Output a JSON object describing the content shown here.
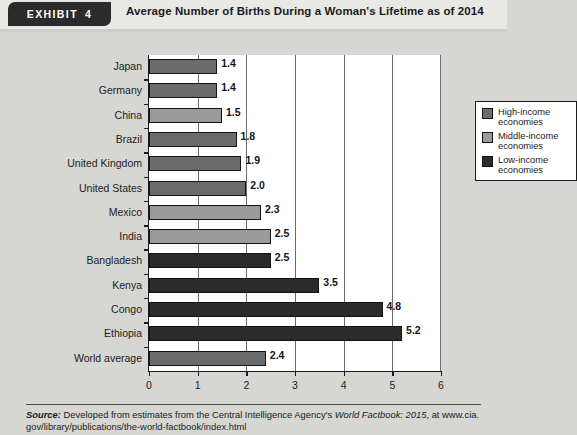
{
  "header": {
    "tag_word": "EXHIBIT",
    "tag_number": "4",
    "title": "Average Number of Births During a Woman's Lifetime as of 2014"
  },
  "legend": {
    "position": "top-right-inside-plot",
    "items": [
      {
        "label": "High-income economies",
        "line1": "High-income",
        "line2": "economies",
        "color": "#6b6b6b"
      },
      {
        "label": "Middle-income economies",
        "line1": "Middle-income",
        "line2": "economies",
        "color": "#9a9a9a"
      },
      {
        "label": "Low-income economies",
        "line1": "Low-income",
        "line2": "economies",
        "color": "#2b2b2b"
      }
    ]
  },
  "source": {
    "label": "Source:",
    "line1": "Developed from estimates from the Central Intelligence Agency's ",
    "italic_title": "World Factbook: 2015",
    "line1_tail": ", at www.cia.",
    "line2": "gov/library/publications/the-world-factbook/index.html"
  },
  "chart_data": {
    "type": "bar",
    "orientation": "horizontal",
    "title": "Average Number of Births During a Woman's Lifetime as of 2014",
    "xlabel": "",
    "ylabel": "",
    "xlim": [
      0,
      6
    ],
    "xticks": [
      "0",
      "1",
      "2",
      "3",
      "4",
      "5",
      "6"
    ],
    "grid": "vertical",
    "categories": [
      "Japan",
      "Germany",
      "China",
      "Brazil",
      "United Kingdom",
      "United States",
      "Mexico",
      "India",
      "Bangladesh",
      "Kenya",
      "Congo",
      "Ethiopia",
      "World average"
    ],
    "values": [
      1.4,
      1.4,
      1.5,
      1.8,
      1.9,
      2.0,
      2.3,
      2.5,
      2.5,
      3.5,
      4.8,
      5.2,
      2.4
    ],
    "value_labels": [
      "1.4",
      "1.4",
      "1.5",
      "1.8",
      "1.9",
      "2.0",
      "2.3",
      "2.5",
      "2.5",
      "3.5",
      "4.8",
      "5.2",
      "2.4"
    ],
    "groups": [
      "High-income",
      "High-income",
      "Middle-income",
      "High-income",
      "High-income",
      "High-income",
      "Middle-income",
      "Middle-income",
      "Low-income",
      "Low-income",
      "Low-income",
      "Low-income",
      "World"
    ],
    "group_colors": {
      "High-income": "#6b6b6b",
      "Middle-income": "#9a9a9a",
      "Low-income": "#2b2b2b",
      "World": "#6b6b6b"
    }
  }
}
